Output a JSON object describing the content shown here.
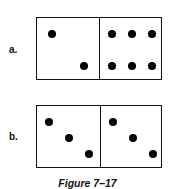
{
  "figure": {
    "caption": "Figure 7–17",
    "dominoes": [
      {
        "label": "a.",
        "left_pips": 2,
        "right_pips": 6
      },
      {
        "label": "b.",
        "left_pips": 3,
        "right_pips": 3
      }
    ]
  }
}
